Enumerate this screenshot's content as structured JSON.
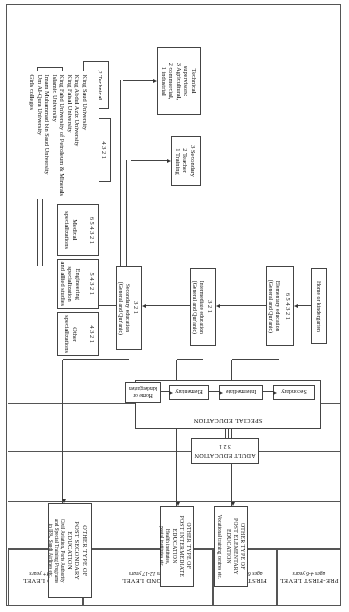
{
  "levels": [
    {
      "name": "THIRD LEVEL",
      "age": "age 18+ years"
    },
    {
      "name": "SECOND LEVEL",
      "age": "ages 12-17 years"
    },
    {
      "name": "FIRST LEVEL",
      "age": "ages 6-11 years"
    },
    {
      "name": "PRE-FIRST LEVEL",
      "age": "ages 4-6 years"
    }
  ],
  "other_post_secondary": {
    "title": "OTHER TYPE OF\nPOST SECONDARY\nEDUCATION",
    "detail": "Civil Aviation, Ports Authority\nand Special Training Programs\nin IPA, Saudi Airlines etc."
  },
  "other_post_intermediate": {
    "title": "OTHER TYPE OF\nPOST INTERMEDIATE\nEDUCATION",
    "detail": "Health institutes,\npostal institutes etc."
  },
  "other_post_elementary": {
    "title": "OTHER TYPE OF\nPOST ELEMENTARY\nEDUCATION",
    "detail": "Vocational training centres etc."
  },
  "universities": {
    "items": "King Saud University\nKing Abdul Aziz University\nKing Faisal University\nKing Fahd University of Petroleum & Minerals\nIslamic University\nImam Muhammad bin Saud University\nUm Al-Qura University\nGirls colleges"
  },
  "adult_education": {
    "title": "ADULT EDUCATION",
    "years": "3      2      1"
  },
  "special_education": {
    "title": "SPECIAL EDUCATION",
    "stages": [
      {
        "label": "Home or\nkindergarten"
      },
      {
        "label": "Elementary"
      },
      {
        "label": "Intermediate"
      },
      {
        "label": "Secondary"
      }
    ]
  },
  "specializations": [
    {
      "name": "Other\nspecializations",
      "years": "4   3   2   1"
    },
    {
      "name": "Engineering\nspecialization\nand allied studies",
      "years": "5  4  3  2  1"
    },
    {
      "name": "Medical\nspecializations",
      "years": "6  5  4  3  2  1"
    }
  ],
  "third_level_boxes": [
    {
      "label": "Higher\ntechnical\ninstitute"
    },
    {
      "label": "2 Technical\n1 colleges"
    },
    {
      "label": "Junior colleges\nand science &\nmaths centers",
      "years": "4    3    2    1"
    }
  ],
  "second_level_boxes": [
    {
      "label": "3  Secondary\n2  Teacher\n1  Training"
    },
    {
      "label": "Technical\nsupervisors:\n3  Agricultural,\n2  commercial,\n1  industrial"
    }
  ],
  "main_chain": [
    {
      "label": "Secondary education\n(General and Qur'anic)",
      "years": "3    2    1"
    },
    {
      "label": "Intermediate education\n(General and Qur'anic)",
      "years": "3    2    1"
    },
    {
      "label": "Elementary education\n(General and Qur'anic)",
      "years": "6  5  4  3  2  1"
    },
    {
      "label": "Home or kindergarten",
      "years": ""
    }
  ]
}
